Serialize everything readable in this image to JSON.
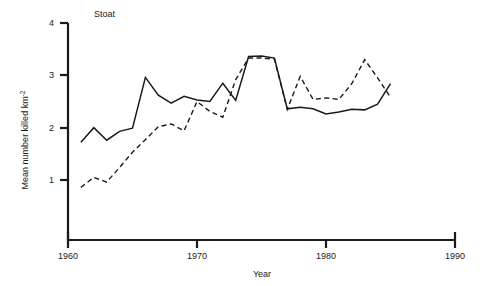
{
  "chart_data": {
    "type": "line",
    "title": "Stoat",
    "xlabel": "Year",
    "ylabel": "Mean number killed km",
    "ylabel_exponent": "-2",
    "xlim": [
      1960,
      1990
    ],
    "ylim": [
      0,
      4
    ],
    "xticks": [
      1960,
      1970,
      1980,
      1990
    ],
    "xtick_labels": [
      "1960",
      "1970",
      "1980",
      "1990"
    ],
    "yticks": [
      1,
      2,
      3,
      4
    ],
    "ytick_labels": [
      "1",
      "2",
      "3",
      "4"
    ],
    "grid": false,
    "legend": "none",
    "x": [
      1961,
      1962,
      1963,
      1964,
      1965,
      1966,
      1967,
      1968,
      1969,
      1970,
      1971,
      1972,
      1973,
      1974,
      1975,
      1976,
      1977,
      1978,
      1979,
      1980,
      1981,
      1982,
      1983,
      1984,
      1985
    ],
    "series": [
      {
        "name": "solid-series",
        "style": "solid",
        "color": "#1a1a1a",
        "values": [
          1.72,
          2.0,
          1.76,
          1.93,
          1.99,
          2.96,
          2.62,
          2.47,
          2.6,
          2.53,
          2.5,
          2.85,
          2.52,
          3.36,
          3.37,
          3.33,
          2.36,
          2.39,
          2.36,
          2.26,
          2.3,
          2.35,
          2.34,
          2.45,
          2.84
        ]
      },
      {
        "name": "dashed-series",
        "style": "dashed",
        "color": "#1a1a1a",
        "values": [
          0.86,
          1.05,
          0.96,
          1.24,
          1.53,
          1.77,
          2.02,
          2.07,
          1.94,
          2.5,
          2.31,
          2.2,
          2.92,
          3.33,
          3.33,
          3.31,
          2.35,
          2.98,
          2.54,
          2.57,
          2.54,
          2.84,
          3.3,
          2.95,
          2.58
        ]
      }
    ],
    "annotations": []
  }
}
